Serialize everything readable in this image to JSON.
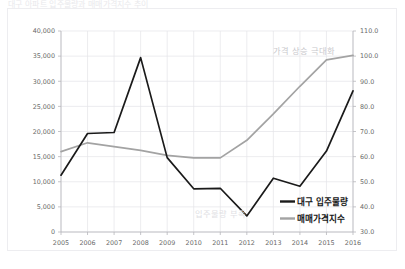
{
  "page": {
    "title": "대구 아파트 입주물량과 매매가격지수 추이"
  },
  "chart_data": {
    "type": "line",
    "title": "대구 아파트 입주물량과 매매가격지수 추이",
    "xlabel": "",
    "categories": [
      "2005",
      "2006",
      "2007",
      "2008",
      "2009",
      "2010",
      "2011",
      "2012",
      "2013",
      "2014",
      "2015",
      "2016"
    ],
    "grid": true,
    "legend_position": "inside-bottom-right",
    "series": [
      {
        "name": "대구 입주물량",
        "axis": "left",
        "color": "#1a1a1a",
        "ylabel": "입주물량",
        "ylim": [
          0,
          40000
        ],
        "yticks": [
          "0",
          "5,000",
          "10,000",
          "15,000",
          "20,000",
          "25,000",
          "30,000",
          "35,000",
          "40,000"
        ],
        "values": [
          11300,
          19600,
          19800,
          34700,
          14800,
          8600,
          8700,
          3200,
          10700,
          9100,
          16100,
          28100
        ]
      },
      {
        "name": "매매가격지수",
        "axis": "right",
        "color": "#a3a3a3",
        "ylabel": "매매가격지수",
        "ylim": [
          30,
          110
        ],
        "yticks": [
          "30.0",
          "40.0",
          "50.0",
          "60.0",
          "70.0",
          "80.0",
          "90.0",
          "100.0",
          "110.0"
        ],
        "values": [
          62.0,
          65.5,
          64.0,
          62.5,
          60.5,
          59.5,
          59.5,
          66.5,
          77.0,
          88.0,
          98.5,
          100.3
        ]
      }
    ],
    "annotations": [
      {
        "text": "가격 상승 극대화",
        "x_category": "2014",
        "position": "top"
      },
      {
        "text": "입주물량 부족",
        "x_category": "2011",
        "position": "bottom"
      }
    ]
  },
  "axes": {
    "left_ticks": [
      "40,000",
      "35,000",
      "30,000",
      "25,000",
      "20,000",
      "15,000",
      "10,000",
      "5,000",
      "0"
    ],
    "right_ticks": [
      "110.0",
      "100.0",
      "90.0",
      "80.0",
      "70.0",
      "60.0",
      "50.0",
      "40.0",
      "30.0"
    ]
  },
  "legend": {
    "items": [
      {
        "label": "대구 입주물량",
        "color": "#1a1a1a"
      },
      {
        "label": "매매가격지수",
        "color": "#a3a3a3"
      }
    ]
  }
}
